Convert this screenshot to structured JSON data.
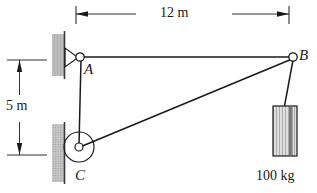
{
  "figure": {
    "kind": "statics-free-body-diagram",
    "background_color": "#ffffff",
    "line_color": "#1a1a1a",
    "wall_fill_color": "#b5b5b5",
    "block_fill_color": "#cfcfcf"
  },
  "dimensions": {
    "horizontal": {
      "label": "12 m",
      "value": 12,
      "unit": "m",
      "from": "A",
      "to": "B",
      "orientation": "horizontal"
    },
    "vertical": {
      "label": "5 m",
      "value": 5,
      "unit": "m",
      "from": "A",
      "to": "C",
      "orientation": "vertical"
    }
  },
  "points": {
    "a": {
      "label": "A",
      "role": "pin-support-on-wall"
    },
    "b": {
      "label": "B",
      "role": "cable-junction-with-load"
    },
    "c": {
      "label": "C",
      "role": "pulley-on-wall"
    }
  },
  "load": {
    "label": "100 kg",
    "value": 100,
    "unit": "kg",
    "attached_at": "B"
  },
  "members": [
    {
      "name": "cable-a-b",
      "from": "A",
      "to": "B"
    },
    {
      "name": "cable-c-b",
      "from": "C",
      "to": "B"
    },
    {
      "name": "cable-a-c",
      "from": "A",
      "to": "C"
    },
    {
      "name": "hanger-b-load",
      "from": "B",
      "to": "load"
    }
  ]
}
